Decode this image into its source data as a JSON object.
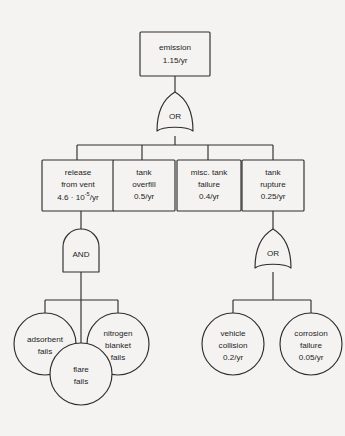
{
  "diagram": {
    "type": "fault-tree",
    "title": "",
    "background_color": "#f4f3f1",
    "stroke_color": "#2e2e2e",
    "text_color": "#1d1d1d"
  },
  "top_event": {
    "id": "emission",
    "shape": "rectangle",
    "label": "emission",
    "rate": "1.15/yr"
  },
  "gates": {
    "top_or": {
      "id": "gate-or-top",
      "type": "OR",
      "label": "OR"
    },
    "vent_and": {
      "id": "gate-and-vent",
      "type": "AND",
      "label": "AND"
    },
    "rupture_or": {
      "id": "gate-or-rupture",
      "type": "OR",
      "label": "OR"
    }
  },
  "intermediate_events": [
    {
      "id": "release-from-vent",
      "shape": "rectangle",
      "line1": "release",
      "line2": "from vent",
      "rate_mantissa": "4.6 ",
      "rate_base": "10",
      "rate_exponent": "-5",
      "rate_unit": "/yr",
      "rate_plain": "4.6 · 10^-5/yr"
    },
    {
      "id": "tank-overfill",
      "shape": "rectangle",
      "line1": "tank",
      "line2": "overfill",
      "rate": "0.5/yr"
    },
    {
      "id": "misc-tank-failure",
      "shape": "rectangle",
      "line1": "misc. tank",
      "line2": "failure",
      "rate": "0.4/yr"
    },
    {
      "id": "tank-rupture",
      "shape": "rectangle",
      "line1": "tank",
      "line2": "rupture",
      "rate": "0.25/yr"
    }
  ],
  "basic_events": [
    {
      "id": "adsorbent-fails",
      "shape": "circle",
      "line1": "adsorbent",
      "line2": "fails",
      "line3": ""
    },
    {
      "id": "nitrogen-blanket-fails",
      "shape": "circle",
      "line1": "nitrogen",
      "line2": "blanket",
      "line3": "fails"
    },
    {
      "id": "flare-fails",
      "shape": "circle",
      "line1": "flare",
      "line2": "fails",
      "line3": ""
    },
    {
      "id": "vehicle-collision",
      "shape": "circle",
      "line1": "vehicle",
      "line2": "collision",
      "line3": "0.2/yr"
    },
    {
      "id": "corrosion-failure",
      "shape": "circle",
      "line1": "corrosion",
      "line2": "failure",
      "line3": "0.05/yr"
    }
  ]
}
